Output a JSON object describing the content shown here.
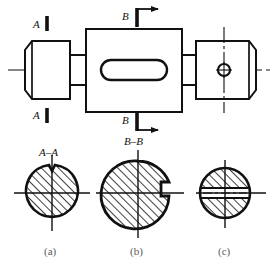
{
  "drawing": {
    "title_labels": {
      "section_a_marker_top": "A",
      "section_a_marker_bottom": "A",
      "section_b_marker_top": "B",
      "section_b_marker_bottom": "B"
    },
    "main_view": {
      "name": "stepped-shaft-front-view",
      "features": [
        "left-cylindrical-end-with-chamfer",
        "left-small-step",
        "center-rectangular-block",
        "center-stadium-slot",
        "right-small-step",
        "right-cylindrical-end-with-chamfer",
        "right-through-hole",
        "horizontal-axis-centerline"
      ]
    },
    "sections": [
      {
        "id": "a",
        "label": "A–A",
        "caption": "(a)",
        "shape": "circle-with-top-notch",
        "hatched": true,
        "hatch_angle_deg": 45
      },
      {
        "id": "b",
        "label": "B–B",
        "caption": "(b)",
        "shape": "circle-with-right-keyway",
        "hatched": true,
        "hatch_angle_deg": 45
      },
      {
        "id": "c",
        "label": "",
        "caption": "(c)",
        "shape": "circle-with-horizontal-through-slot",
        "hatched": true,
        "hatch_angle_deg": 45
      }
    ],
    "colors": {
      "line": "#111111",
      "background": "#ffffff",
      "caption": "#5a5a5a"
    }
  }
}
